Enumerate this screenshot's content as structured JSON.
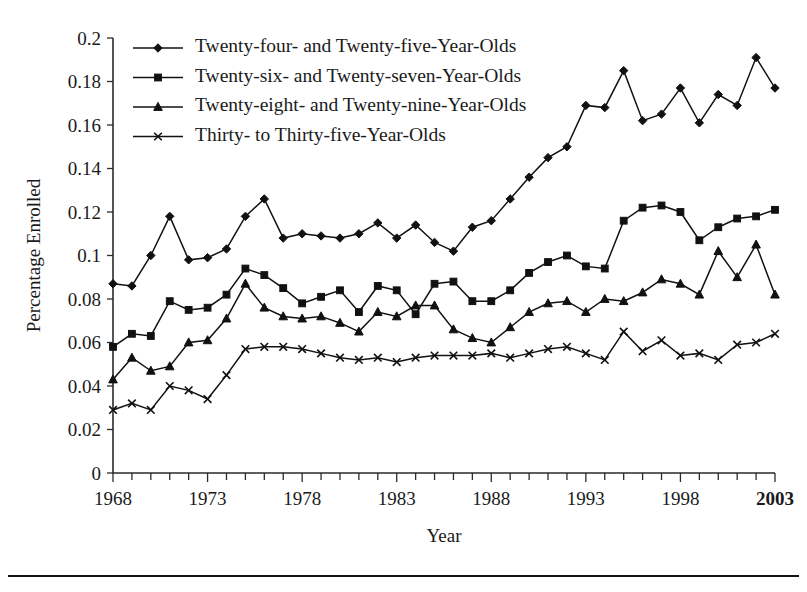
{
  "figure": {
    "background": "#ffffff",
    "ink_color": "#111111",
    "bottom_rule": true
  },
  "chart_data": {
    "type": "line",
    "title": "",
    "xlabel": "Year",
    "ylabel": "Percentage Enrolled",
    "grid": false,
    "legend_position": "top-left-inside",
    "xlim": [
      1968,
      2003
    ],
    "ylim": [
      0,
      0.2
    ],
    "ytick_step": 0.02,
    "ytick_labels": [
      "0",
      "0.02",
      "0.04",
      "0.06",
      "0.08",
      "0.1",
      "0.12",
      "0.14",
      "0.16",
      "0.18",
      "0.2"
    ],
    "ytick_values": [
      0,
      0.02,
      0.04,
      0.06,
      0.08,
      0.1,
      0.12,
      0.14,
      0.16,
      0.18,
      0.2
    ],
    "xtick_labels": [
      "1968",
      "1973",
      "1978",
      "1983",
      "1988",
      "1993",
      "1998",
      "2003"
    ],
    "xtick_values": [
      1968,
      1973,
      1978,
      1983,
      1988,
      1993,
      1998,
      2003
    ],
    "x": [
      1968,
      1969,
      1970,
      1971,
      1972,
      1973,
      1974,
      1975,
      1976,
      1977,
      1978,
      1979,
      1980,
      1981,
      1982,
      1983,
      1984,
      1985,
      1986,
      1987,
      1988,
      1989,
      1990,
      1991,
      1992,
      1993,
      1994,
      1995,
      1996,
      1997,
      1998,
      1999,
      2000,
      2001,
      2002,
      2003
    ],
    "series": [
      {
        "name": "Twenty-four- and Twenty-five-Year-Olds",
        "marker": "diamond",
        "values": [
          0.087,
          0.086,
          0.1,
          0.118,
          0.098,
          0.099,
          0.103,
          0.118,
          0.126,
          0.108,
          0.11,
          0.109,
          0.108,
          0.11,
          0.115,
          0.108,
          0.114,
          0.106,
          0.102,
          0.113,
          0.116,
          0.126,
          0.136,
          0.145,
          0.15,
          0.169,
          0.168,
          0.185,
          0.162,
          0.165,
          0.177,
          0.161,
          0.174,
          0.169,
          0.191,
          0.177
        ]
      },
      {
        "name": "Twenty-six- and Twenty-seven-Year-Olds",
        "marker": "square",
        "values": [
          0.058,
          0.064,
          0.063,
          0.079,
          0.075,
          0.076,
          0.082,
          0.094,
          0.091,
          0.085,
          0.078,
          0.081,
          0.084,
          0.074,
          0.086,
          0.084,
          0.073,
          0.087,
          0.088,
          0.079,
          0.079,
          0.084,
          0.092,
          0.097,
          0.1,
          0.095,
          0.094,
          0.116,
          0.122,
          0.123,
          0.12,
          0.107,
          0.113,
          0.117,
          0.118,
          0.121
        ]
      },
      {
        "name": "Twenty-eight- and Twenty-nine-Year-Olds",
        "marker": "triangle",
        "values": [
          0.043,
          0.053,
          0.047,
          0.049,
          0.06,
          0.061,
          0.071,
          0.087,
          0.076,
          0.072,
          0.071,
          0.072,
          0.069,
          0.065,
          0.074,
          0.072,
          0.077,
          0.077,
          0.066,
          0.062,
          0.06,
          0.067,
          0.074,
          0.078,
          0.079,
          0.074,
          0.08,
          0.079,
          0.083,
          0.089,
          0.087,
          0.082,
          0.102,
          0.09,
          0.105,
          0.082
        ]
      },
      {
        "name": "Thirty- to Thirty-five-Year-Olds",
        "marker": "x",
        "values": [
          0.029,
          0.032,
          0.029,
          0.04,
          0.038,
          0.034,
          0.045,
          0.057,
          0.058,
          0.058,
          0.057,
          0.055,
          0.053,
          0.052,
          0.053,
          0.051,
          0.053,
          0.054,
          0.054,
          0.054,
          0.055,
          0.053,
          0.055,
          0.057,
          0.058,
          0.055,
          0.052,
          0.065,
          0.056,
          0.061,
          0.054,
          0.055,
          0.052,
          0.059,
          0.06,
          0.064
        ]
      }
    ]
  }
}
